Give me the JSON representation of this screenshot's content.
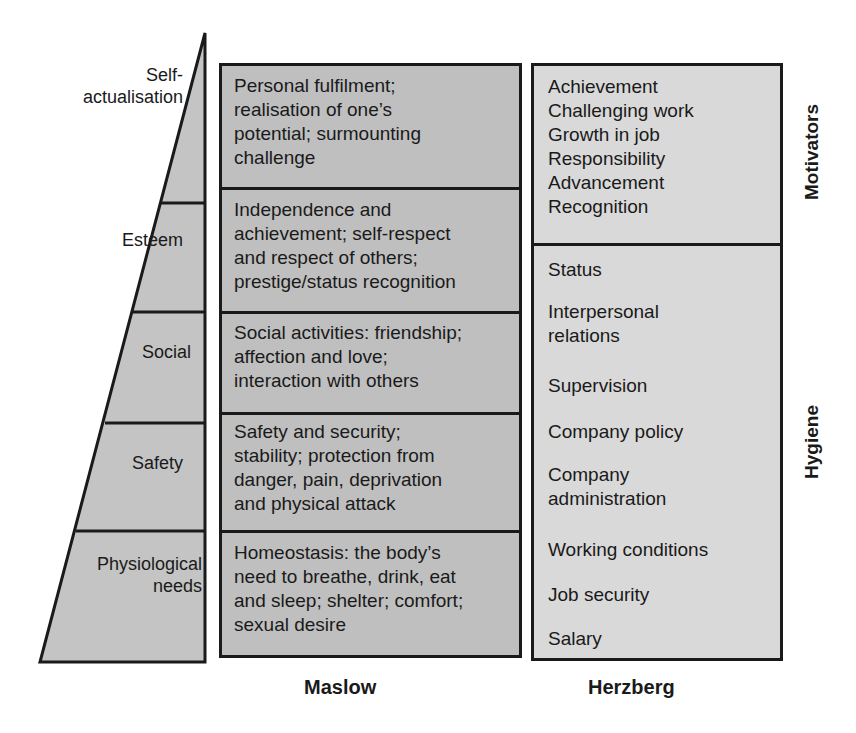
{
  "pyramid": {
    "levels": [
      {
        "label": "Self-\nactualisation",
        "line1": "Self-",
        "line2": "actualisation"
      },
      {
        "label": "Esteem"
      },
      {
        "label": "Social"
      },
      {
        "label": "Safety"
      },
      {
        "label": "Physiological needs",
        "line1": "Physiological",
        "line2": "needs"
      }
    ]
  },
  "maslow": {
    "title": "Maslow",
    "cells": [
      {
        "lines": [
          "Personal fulfilment;",
          "realisation of one’s",
          "potential; surmounting",
          "challenge"
        ]
      },
      {
        "lines": [
          "Independence and",
          "achievement; self-respect",
          "and respect of others;",
          "prestige/status recognition"
        ]
      },
      {
        "lines": [
          "Social activities: friendship;",
          "affection and love;",
          "interaction with others"
        ]
      },
      {
        "lines": [
          "Safety and security;",
          "stability; protection from",
          "danger, pain, deprivation",
          "and physical attack"
        ]
      },
      {
        "lines": [
          "Homeostasis: the body’s",
          "need to breathe, drink, eat",
          "and sleep; shelter; comfort;",
          "sexual desire"
        ]
      }
    ]
  },
  "herzberg": {
    "title": "Herzberg",
    "motivators_label": "Motivators",
    "hygiene_label": "Hygiene",
    "motivators": [
      "Achievement",
      "Challenging work",
      "Growth in job",
      "Responsibility",
      "Advancement",
      "Recognition"
    ],
    "hygiene": [
      {
        "lines": [
          "Status"
        ]
      },
      {
        "lines": [
          "Interpersonal",
          "relations"
        ]
      },
      {
        "lines": [
          "Supervision"
        ]
      },
      {
        "lines": [
          "Company policy"
        ]
      },
      {
        "lines": [
          "Company",
          "administration"
        ]
      },
      {
        "lines": [
          "Working conditions"
        ]
      },
      {
        "lines": [
          "Job security"
        ]
      },
      {
        "lines": [
          "Salary"
        ]
      }
    ]
  },
  "colors": {
    "maslow_fill": "#bfbfbf",
    "herzberg_fill": "#d9d9d9",
    "pyramid_fill": "#c4c4c4",
    "stroke": "#1a1a1a"
  }
}
